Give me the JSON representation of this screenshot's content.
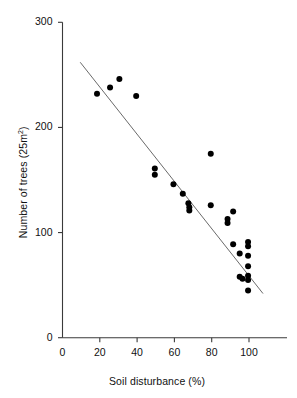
{
  "chart_data": {
    "type": "scatter",
    "title": "",
    "xlabel": "Soil disturbance (%)",
    "ylabel": "Number of trees (25m²)",
    "ylabel_base": "Number of trees (25m",
    "ylabel_sup": "2",
    "ylabel_close": ")",
    "xlim": [
      0,
      113
    ],
    "ylim": [
      0,
      300
    ],
    "xticks": [
      0,
      20,
      40,
      60,
      80,
      100
    ],
    "yticks": [
      0,
      100,
      200,
      300
    ],
    "xtick_labels": [
      "0",
      "20",
      "40",
      "60",
      "80",
      "100"
    ],
    "ytick_labels": [
      "0",
      "100",
      "200",
      "300"
    ],
    "grid": false,
    "legend": false,
    "marker_color": "#000000",
    "marker_size_px": 6,
    "axis_color": "#3a3a3a",
    "trendline_color": "#6a6a6a",
    "points": [
      {
        "x": 18.5,
        "y": 232
      },
      {
        "x": 25.5,
        "y": 238
      },
      {
        "x": 30.5,
        "y": 246
      },
      {
        "x": 39.5,
        "y": 230
      },
      {
        "x": 49.5,
        "y": 161
      },
      {
        "x": 49.5,
        "y": 155
      },
      {
        "x": 59.5,
        "y": 146
      },
      {
        "x": 64.5,
        "y": 137
      },
      {
        "x": 67.5,
        "y": 128
      },
      {
        "x": 68.0,
        "y": 124
      },
      {
        "x": 68.0,
        "y": 121
      },
      {
        "x": 79.5,
        "y": 175
      },
      {
        "x": 79.5,
        "y": 126
      },
      {
        "x": 88.5,
        "y": 113
      },
      {
        "x": 88.5,
        "y": 109
      },
      {
        "x": 91.5,
        "y": 120
      },
      {
        "x": 91.5,
        "y": 89
      },
      {
        "x": 95.0,
        "y": 80
      },
      {
        "x": 95.0,
        "y": 58
      },
      {
        "x": 96.5,
        "y": 56
      },
      {
        "x": 99.5,
        "y": 91
      },
      {
        "x": 99.5,
        "y": 87
      },
      {
        "x": 99.5,
        "y": 78
      },
      {
        "x": 99.5,
        "y": 68
      },
      {
        "x": 99.5,
        "y": 59
      },
      {
        "x": 99.5,
        "y": 55
      },
      {
        "x": 99.5,
        "y": 45
      }
    ],
    "trendline": {
      "x0": 9.5,
      "y0": 262,
      "x1": 107.5,
      "y1": 42
    }
  }
}
